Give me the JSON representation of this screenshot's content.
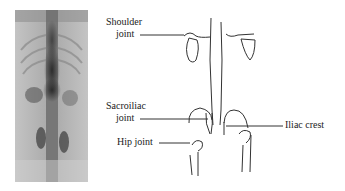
{
  "figure": {
    "scan_image": "bone-scan-spine-pelvis",
    "labels": {
      "shoulder_joint": [
        "Shoulder",
        "joint"
      ],
      "sacroiliac_joint": [
        "Sacroiliac",
        "joint"
      ],
      "hip_joint": "Hip joint",
      "iliac_crest": "Iliac crest"
    },
    "colors": {
      "line": "#333333",
      "scan_dark": "#2a2a2a",
      "scan_light": "#c8c8c8"
    }
  }
}
